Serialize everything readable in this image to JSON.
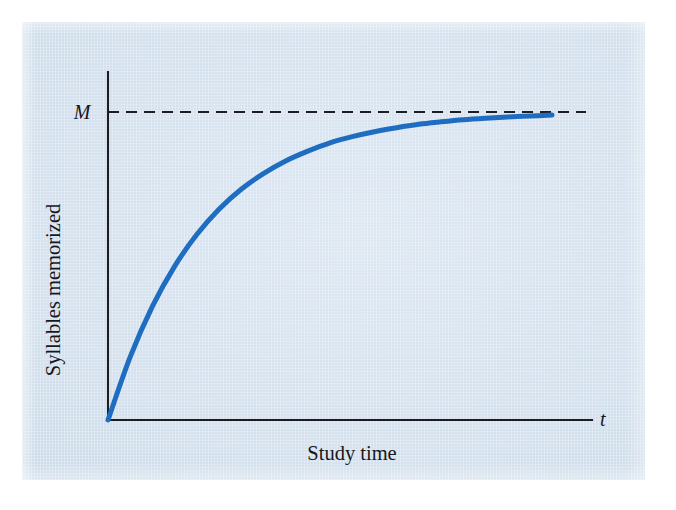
{
  "figure": {
    "panel_background_color": "#d8e4ef",
    "page_background_color": "#ffffff",
    "curve_color": "#1f6dc0",
    "axis_color": "#1c1c22"
  },
  "labels": {
    "y_axis_label": "Syllables memorized",
    "x_axis_label": "Study time",
    "x_axis_variable": "t",
    "asymptote_label": "M"
  },
  "chart_data": {
    "type": "line",
    "title": "",
    "subtitle": "",
    "xlabel": "Study time",
    "ylabel": "Syllables memorized",
    "x_axis_variable": "t",
    "grid": false,
    "legend": "none",
    "annotations": [
      {
        "text": "M",
        "kind": "y-axis-tick-label",
        "meaning": "horizontal dashed asymptote marking the maximum number of syllables that can be memorized",
        "y_value": 1.0
      },
      {
        "text": "t",
        "kind": "x-axis-variable-label",
        "meaning": "time variable at the right end of the horizontal axis"
      }
    ],
    "reference_lines": [
      {
        "orientation": "horizontal",
        "style": "dashed",
        "label": "M",
        "y_value": 1.0,
        "color": "#1c1c22"
      }
    ],
    "xlim": [
      0,
      1.08
    ],
    "ylim": [
      0,
      1.09
    ],
    "axis_ticks": {
      "x": [],
      "y": [
        "M"
      ]
    },
    "series": [
      {
        "name": "Syllables memorized",
        "color": "#1f6dc0",
        "model": "y = M * (1 - exp(-k*t))",
        "model_parameters": {
          "M": 1.0,
          "k": 4.6
        },
        "x": [
          0.0,
          0.05,
          0.1,
          0.15,
          0.2,
          0.25,
          0.3,
          0.35,
          0.4,
          0.45,
          0.5,
          0.55,
          0.6,
          0.65,
          0.7,
          0.75,
          0.8,
          0.85,
          0.9,
          0.95,
          1.0
        ],
        "y": [
          0.0,
          0.205,
          0.369,
          0.499,
          0.602,
          0.684,
          0.749,
          0.8,
          0.841,
          0.873,
          0.9,
          0.92,
          0.936,
          0.949,
          0.96,
          0.968,
          0.975,
          0.98,
          0.984,
          0.987,
          0.99
        ]
      }
    ]
  }
}
